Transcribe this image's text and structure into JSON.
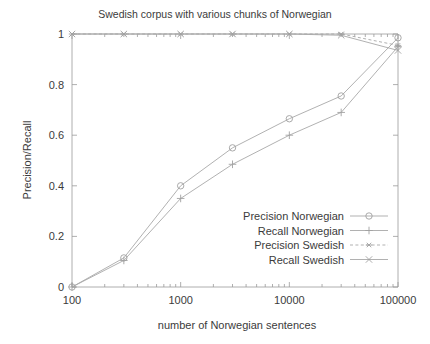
{
  "chart_data": {
    "type": "line",
    "title": "Swedish corpus with various chunks of Norwegian",
    "xlabel": "number of Norwegian sentences",
    "ylabel": "Precision/Recall",
    "xscale": "log",
    "xlim": [
      100,
      100000
    ],
    "ylim": [
      0,
      1
    ],
    "xticks": [
      100,
      1000,
      10000,
      100000
    ],
    "xtick_labels": [
      "100",
      "1000",
      "10000",
      "100000"
    ],
    "yticks": [
      0,
      0.2,
      0.4,
      0.6,
      0.8,
      1
    ],
    "ytick_labels": [
      "0",
      "0.2",
      "0.4",
      "0.6",
      "0.8",
      "1"
    ],
    "grid": false,
    "legend_position": "inside lower right",
    "x": [
      100,
      300,
      1000,
      3000,
      10000,
      30000,
      100000
    ],
    "series": [
      {
        "name": "Precision Norwegian",
        "marker": "circle",
        "dash": "solid",
        "values": [
          0.0,
          0.115,
          0.4,
          0.55,
          0.665,
          0.755,
          0.985
        ]
      },
      {
        "name": "Recall Norwegian",
        "marker": "plus",
        "dash": "solid",
        "values": [
          0.0,
          0.105,
          0.35,
          0.485,
          0.6,
          0.69,
          0.95
        ]
      },
      {
        "name": "Precision Swedish",
        "marker": "star",
        "dash": "dashed",
        "values": [
          1.0,
          1.0,
          1.0,
          1.0,
          1.0,
          1.0,
          0.955
        ]
      },
      {
        "name": "Recall Swedish",
        "marker": "cross",
        "dash": "solid",
        "values": [
          1.0,
          1.0,
          1.0,
          1.0,
          1.0,
          0.995,
          0.935
        ]
      }
    ],
    "colors": {
      "line": "#a8a8a8",
      "axis": "#9a9a9a",
      "text": "#3b3b3b",
      "background": "#ffffff"
    }
  }
}
